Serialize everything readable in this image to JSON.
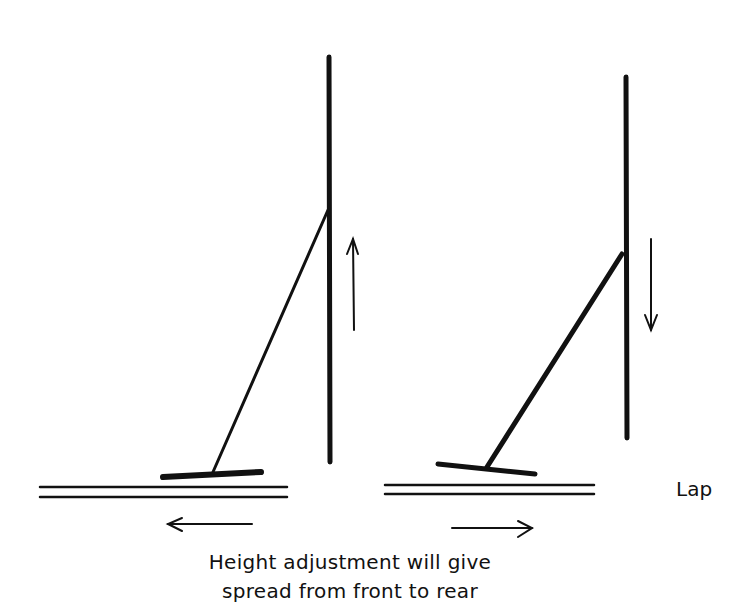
{
  "labels": {
    "lap": "Lap",
    "caption_line1": "Height adjustment will give",
    "caption_line2": "spread from front to rear"
  },
  "diagram": {
    "left_assembly": {
      "pole_direction": "up",
      "lap_motion": "left"
    },
    "right_assembly": {
      "pole_direction": "down",
      "lap_motion": "right"
    }
  },
  "colors": {
    "stroke": "#111111",
    "background": "#ffffff"
  }
}
